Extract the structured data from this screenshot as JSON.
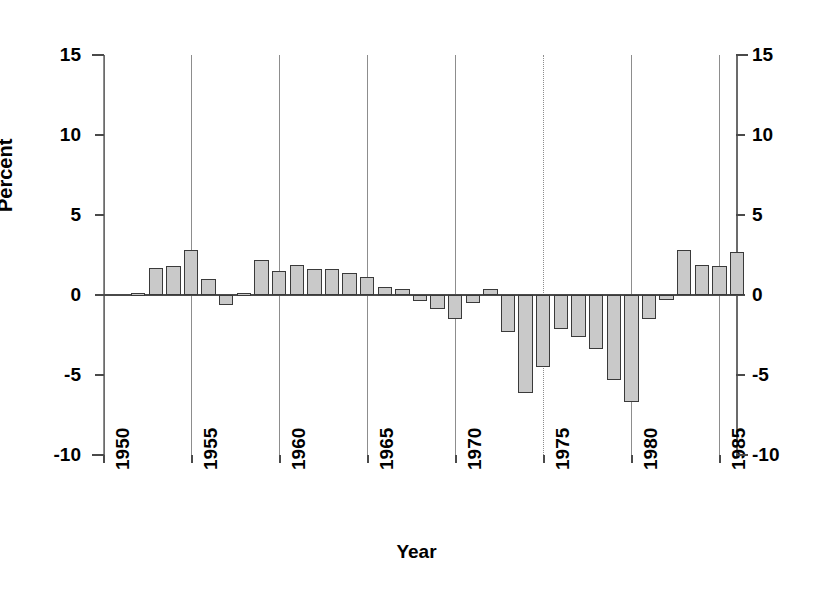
{
  "chart_data": {
    "type": "bar",
    "title": "",
    "xlabel": "Year",
    "ylabel": "Percent",
    "ylim": [
      -10,
      15
    ],
    "xlim": [
      1950,
      1986
    ],
    "yticks": [
      15,
      10,
      5,
      0,
      -5,
      -10
    ],
    "ytick_labels": [
      "15",
      "10",
      "5",
      "0",
      "-5",
      "-10"
    ],
    "yticks_right": [
      15,
      10,
      5,
      0,
      -5,
      -10
    ],
    "ytick_labels_right": [
      "15",
      "10",
      "5",
      "0",
      "-5",
      "-10"
    ],
    "xticks": [
      1950,
      1955,
      1960,
      1965,
      1970,
      1975,
      1980,
      1985
    ],
    "xtick_labels": [
      "1950",
      "1955",
      "1960",
      "1965",
      "1970",
      "1975",
      "1980",
      "1985"
    ],
    "grid": "vertical-only",
    "legend": "none",
    "bar_fill_color": "#c9c9c9",
    "bar_edge_color": "#3a3a3a",
    "axis_color": "#4a4a4a",
    "gridline_color": "#8d8d8d",
    "background_color": "#ffffff",
    "categories": [
      1952,
      1953,
      1954,
      1955,
      1956,
      1957,
      1958,
      1959,
      1960,
      1961,
      1962,
      1963,
      1964,
      1965,
      1966,
      1967,
      1968,
      1969,
      1970,
      1971,
      1972,
      1973,
      1974,
      1975,
      1976,
      1977,
      1978,
      1979,
      1980,
      1981,
      1982,
      1983,
      1984,
      1985,
      1986
    ],
    "values": [
      0.1,
      1.7,
      1.8,
      2.8,
      1.0,
      -0.6,
      0.1,
      2.2,
      1.5,
      1.9,
      1.6,
      1.6,
      1.4,
      1.1,
      0.5,
      0.4,
      -0.4,
      -0.9,
      -1.5,
      -0.5,
      0.4,
      -2.3,
      -6.1,
      -4.5,
      -2.1,
      -2.6,
      -3.4,
      -5.3,
      -6.7,
      -1.5,
      -0.3,
      2.8,
      1.9,
      1.8,
      2.7
    ],
    "values_unit": "percent"
  },
  "axis": {
    "y_title": "Percent",
    "x_title": "Year"
  }
}
